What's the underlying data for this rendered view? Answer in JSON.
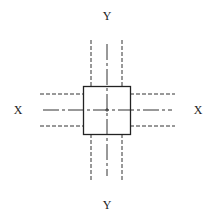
{
  "diagram": {
    "labels": {
      "top": "Y",
      "bottom": "Y",
      "left": "X",
      "right": "X"
    },
    "colors": {
      "stroke": "#222222",
      "background": "#ffffff"
    },
    "square": {
      "x": 83,
      "y": 86,
      "width": 47,
      "height": 48
    },
    "center": {
      "x": 107,
      "y": 110
    }
  }
}
